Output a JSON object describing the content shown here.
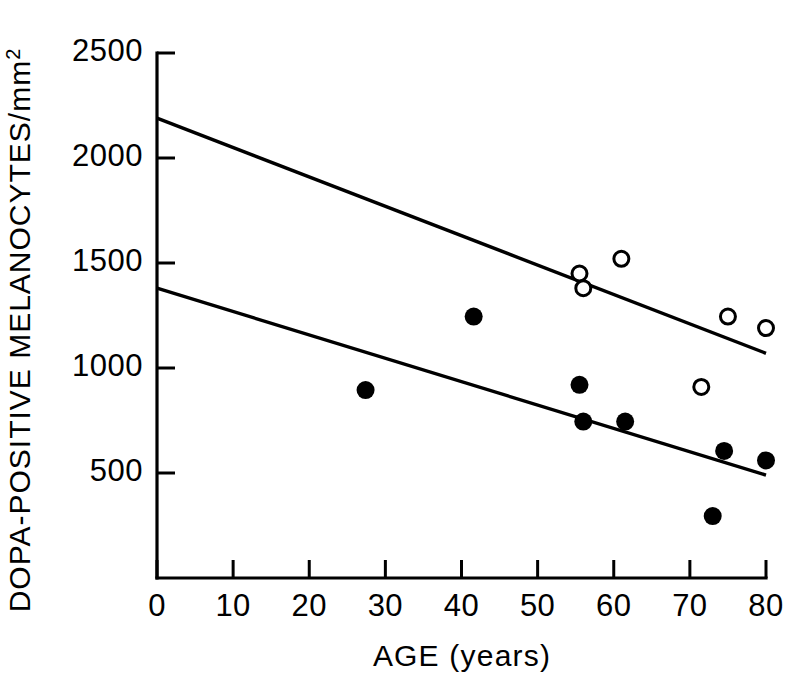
{
  "chart_data": {
    "type": "scatter",
    "title": "",
    "subtitle": "",
    "xlabel": "AGE (years)",
    "ylabel": "DOPA-POSITIVE MELANOCYTES/mm",
    "ylabel_exponent": "2",
    "xlim": [
      0,
      80
    ],
    "ylim": [
      0,
      2500
    ],
    "xticks": [
      0,
      10,
      20,
      30,
      40,
      50,
      60,
      70,
      80
    ],
    "xtick_labels": [
      "0",
      "10",
      "20",
      "30",
      "40",
      "50",
      "60",
      "70",
      "80"
    ],
    "yticks": [
      500,
      1000,
      1500,
      2000,
      2500
    ],
    "ytick_labels": [
      "500",
      "1000",
      "1500",
      "2000",
      "2500"
    ],
    "grid": false,
    "legend": "none",
    "marker_colors": {
      "filled": "#000000",
      "open_stroke": "#000000",
      "open_fill": "#ffffff",
      "line": "#000000",
      "axis": "#000000",
      "background": "#ffffff"
    },
    "series": [
      {
        "name": "open-circles",
        "marker": "open-circle",
        "points": [
          {
            "x": 55.5,
            "y": 1450
          },
          {
            "x": 56.0,
            "y": 1380
          },
          {
            "x": 61.0,
            "y": 1520
          },
          {
            "x": 71.5,
            "y": 910
          },
          {
            "x": 75.0,
            "y": 1245
          },
          {
            "x": 80.0,
            "y": 1190
          }
        ]
      },
      {
        "name": "filled-circles",
        "marker": "filled-circle",
        "points": [
          {
            "x": 27.4,
            "y": 895
          },
          {
            "x": 41.6,
            "y": 1245
          },
          {
            "x": 55.5,
            "y": 920
          },
          {
            "x": 56.0,
            "y": 745
          },
          {
            "x": 61.5,
            "y": 745
          },
          {
            "x": 73.0,
            "y": 295
          },
          {
            "x": 74.5,
            "y": 605
          },
          {
            "x": 80.0,
            "y": 560
          }
        ]
      }
    ],
    "trend_lines": [
      {
        "name": "upper-regression-line",
        "x0": 0,
        "y0": 2190,
        "x1": 80,
        "y1": 1070
      },
      {
        "name": "lower-regression-line",
        "x0": 0,
        "y0": 1380,
        "x1": 80,
        "y1": 490
      }
    ]
  }
}
